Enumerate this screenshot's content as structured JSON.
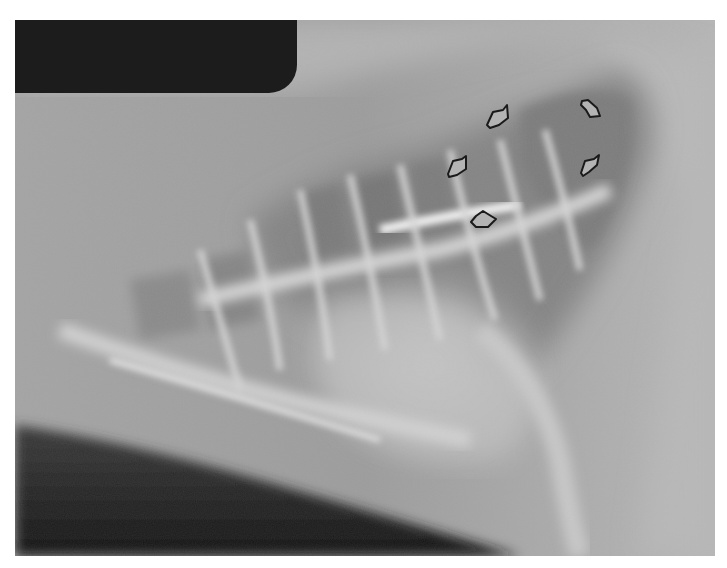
{
  "image": {
    "type": "lateral thoracic radiograph",
    "description": "Grayscale lateral chest radiograph with a dark film-label block in the upper-left corner and five open arrow markers outlining a region in the dorsocaudal lung field.",
    "colors": {
      "background_mid": "#9a9a9a",
      "soft_tissue_light": "#c8c8c8",
      "bone_bright": "#e6e6e6",
      "lung_dark": "#7a7a7a",
      "air_black": "#1c1c1c",
      "arrow_stroke": "#1a1a1a",
      "arrow_fill": "#b4b4b4"
    }
  },
  "label_block": {
    "color": "#1c1c1c"
  },
  "arrows": [
    {
      "id": 1,
      "x": 497,
      "y": 118,
      "direction": "down-left"
    },
    {
      "id": 2,
      "x": 457,
      "y": 167,
      "direction": "down-left"
    },
    {
      "id": 3,
      "x": 591,
      "y": 108,
      "direction": "up-left"
    },
    {
      "id": 4,
      "x": 590,
      "y": 165,
      "direction": "down-left"
    },
    {
      "id": 5,
      "x": 483,
      "y": 219,
      "direction": "up"
    }
  ]
}
